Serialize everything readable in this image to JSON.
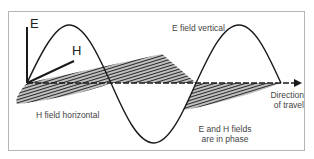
{
  "diagram": {
    "labels": {
      "e_axis": "E",
      "h_axis": "H",
      "e_field": "E field vertical",
      "h_field": "H field horizontal",
      "direction_line1": "Direction",
      "direction_line2": "of travel",
      "phase_line1": "E and H fields",
      "phase_line2": "are in phase"
    },
    "colors": {
      "line": "#1a1a1a",
      "hatch": "#333333",
      "frame": "#b5b5b5",
      "text": "#444444"
    }
  }
}
